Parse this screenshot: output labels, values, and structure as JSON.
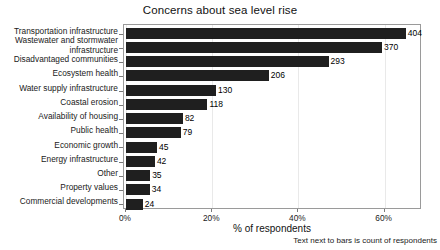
{
  "chart_data": {
    "type": "bar",
    "orientation": "horizontal",
    "title": "Concerns about sea level rise",
    "xlabel": "% of respondents",
    "ylabel": "",
    "footnote": "Text next to bars is count of respondents",
    "grid": true,
    "legend": "none",
    "xlim": [
      0,
      68.2
    ],
    "xticks": [
      "0%",
      "20%",
      "40%",
      "60%"
    ],
    "xtick_values": [
      0,
      20,
      40,
      60
    ],
    "total_respondents": 579,
    "categories": [
      "Transportation infrastructure",
      "Wastewater and stormwater\ninfrastructure",
      "Disadvantaged communities",
      "Ecosystem health",
      "Water supply infrastructure",
      "Coastal erosion",
      "Availability of housing",
      "Public health",
      "Economic growth",
      "Energy infrastructure",
      "Other",
      "Property values",
      "Commercial developments"
    ],
    "values": [
      404,
      370,
      293,
      206,
      130,
      118,
      82,
      79,
      45,
      42,
      35,
      34,
      24
    ],
    "value_labels": [
      "404",
      "370",
      "293",
      "206",
      "130",
      "118",
      "82",
      "79",
      "45",
      "42",
      "35",
      "34",
      "24"
    ],
    "percent_values": [
      64.9,
      59.4,
      47.0,
      33.1,
      20.9,
      18.9,
      13.2,
      12.7,
      7.2,
      6.7,
      5.6,
      5.5,
      3.9
    ],
    "bar_color": "#1f1f1f",
    "grid_color": "#e9e9e9",
    "axis_color": "#9a9a9a",
    "background_color": "#ffffff"
  }
}
